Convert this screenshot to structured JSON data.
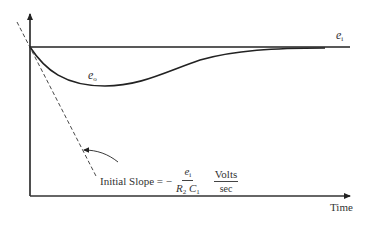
{
  "diagram": {
    "type": "time-response-plot",
    "x_axis": {
      "label": "Time"
    },
    "curves": {
      "input": {
        "label_main": "e",
        "label_sub": "i",
        "description": "constant input step level"
      },
      "output": {
        "label_main": "e",
        "label_sub": "o",
        "description": "output dipping then recovering toward e_i"
      }
    },
    "tangent_line": {
      "style": "dashed",
      "description": "initial slope tangent"
    },
    "annotation": {
      "prefix": "Initial Slope = −",
      "fraction_numerator_main": "e",
      "fraction_numerator_sub": "i",
      "fraction_denominator_1_main": "R",
      "fraction_denominator_1_sub": "2",
      "fraction_denominator_2_main": "C",
      "fraction_denominator_2_sub": "1",
      "units_numerator": "Volts",
      "units_denominator": "sec"
    },
    "colors": {
      "line": "#222222",
      "background": "#ffffff"
    }
  }
}
